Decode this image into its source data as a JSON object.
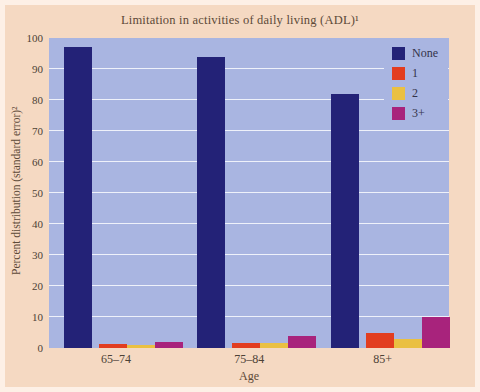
{
  "figure": {
    "title": "Limitation in activities of daily living (ADL)¹",
    "y_axis_title": "Percent distribution (standard error)²",
    "x_axis_title": "Age"
  },
  "chart_data": {
    "type": "bar",
    "title": "Limitation in activities of daily living (ADL)¹",
    "xlabel": "Age",
    "ylabel": "Percent distribution (standard error)²",
    "categories": [
      "65–74",
      "75–84",
      "85+"
    ],
    "series": [
      {
        "name": "None",
        "color": "#232277",
        "values": [
          97,
          94,
          82
        ]
      },
      {
        "name": "1",
        "color": "#e23d1f",
        "values": [
          1.3,
          1.7,
          5
        ]
      },
      {
        "name": "2",
        "color": "#eac042",
        "values": [
          1,
          1.7,
          3
        ]
      },
      {
        "name": "3+",
        "color": "#a8237c",
        "values": [
          2,
          4,
          10
        ]
      }
    ],
    "ylim": [
      0,
      100
    ],
    "yticks": [
      0,
      10,
      20,
      30,
      40,
      50,
      60,
      70,
      80,
      90,
      100
    ],
    "grid": true,
    "gridline_color": "#eef1fa",
    "plot_background": "#a9b5e1",
    "panel_background": "#f5d9c2",
    "outer_border_color": "#fdf0e6",
    "legend_position": "top-right"
  }
}
